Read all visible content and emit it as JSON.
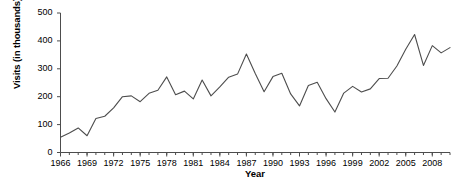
{
  "chart_data": {
    "type": "line",
    "title": "",
    "xlabel": "Year",
    "ylabel": "Visits (in thousands)",
    "xlim": [
      1966,
      2010
    ],
    "ylim": [
      0,
      500
    ],
    "grid": false,
    "legend": null,
    "y_ticks": [
      0,
      100,
      200,
      300,
      400,
      500
    ],
    "y_tick_labels": [
      "0",
      "100",
      "200",
      "300",
      "400",
      "500"
    ],
    "x_ticks": [
      1966,
      1969,
      1972,
      1975,
      1978,
      1981,
      1984,
      1987,
      1990,
      1993,
      1996,
      1999,
      2002,
      2005,
      2008
    ],
    "x_tick_labels": [
      "1966",
      "1969",
      "1972",
      "1975",
      "1978",
      "1981",
      "1984",
      "1987",
      "1990",
      "1993",
      "1996",
      "1999",
      "2002",
      "2005",
      "2008"
    ],
    "x_minor_tick_step": 1,
    "line_color": "#4d4d4d",
    "x": [
      1966,
      1967,
      1968,
      1969,
      1970,
      1971,
      1972,
      1973,
      1974,
      1975,
      1976,
      1977,
      1978,
      1979,
      1980,
      1981,
      1982,
      1983,
      1984,
      1985,
      1986,
      1987,
      1988,
      1989,
      1990,
      1991,
      1992,
      1993,
      1994,
      1995,
      1996,
      1997,
      1998,
      1999,
      2000,
      2001,
      2002,
      2003,
      2004,
      2005,
      2006,
      2007,
      2008,
      2009,
      2010
    ],
    "values": [
      55,
      70,
      88,
      60,
      122,
      130,
      160,
      200,
      203,
      182,
      212,
      223,
      271,
      207,
      220,
      192,
      260,
      203,
      235,
      270,
      281,
      353,
      283,
      218,
      272,
      284,
      210,
      167,
      240,
      252,
      193,
      145,
      213,
      237,
      217,
      228,
      265,
      266,
      310,
      370,
      423,
      312,
      383,
      357,
      376
    ]
  }
}
